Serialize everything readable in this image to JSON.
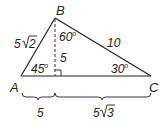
{
  "diagram": {
    "type": "triangle",
    "vertices": {
      "A": "A",
      "B": "B",
      "C": "C"
    },
    "sides": {
      "AB": {
        "coef": "5",
        "radicand": "2"
      },
      "BC": "10",
      "altitude": "5"
    },
    "angles": {
      "A": "45",
      "C": "30",
      "B_part": "60",
      "degree_mark": "o"
    },
    "base_segments": {
      "left": "5",
      "right": {
        "coef": "5",
        "radicand": "3"
      }
    },
    "colors": {
      "line": "#222222",
      "dashed": "#555555",
      "background": "#ffffff"
    }
  }
}
